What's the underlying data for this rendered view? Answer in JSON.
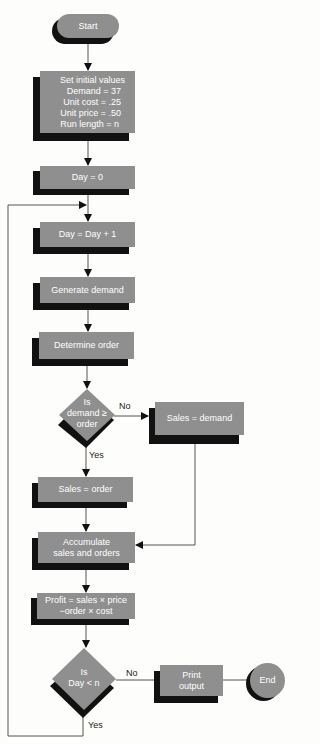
{
  "diagram": {
    "type": "flowchart",
    "colors": {
      "node_fill": "#8f8f8f",
      "shadow": "#111111",
      "text": "#ffffff",
      "line": "#444444"
    },
    "start": {
      "label": "Start"
    },
    "init": {
      "title": "Set initial values",
      "lines": [
        "Demand = 37",
        "Unit cost = .25",
        "Unit price = .50",
        "Run length = n"
      ]
    },
    "day_zero": {
      "label": "Day = 0"
    },
    "day_inc": {
      "label": "Day = Day + 1"
    },
    "generate": {
      "label": "Generate demand"
    },
    "determine": {
      "label": "Determine order"
    },
    "decision1": {
      "line1": "Is",
      "line2": "demand ≥",
      "line3": "order",
      "no": "No",
      "yes": "Yes"
    },
    "sales_demand": {
      "label": "Sales = demand"
    },
    "sales_order": {
      "label": "Sales = order"
    },
    "accumulate": {
      "line1": "Accumulate",
      "line2": "sales and orders"
    },
    "profit": {
      "line1": "Profit = sales × price",
      "line2": "−order × cost"
    },
    "decision2": {
      "line1": "Is",
      "line2": "Day < n",
      "no": "No",
      "yes": "Yes"
    },
    "print": {
      "line1": "Print",
      "line2": "output"
    },
    "end": {
      "label": "End"
    }
  }
}
